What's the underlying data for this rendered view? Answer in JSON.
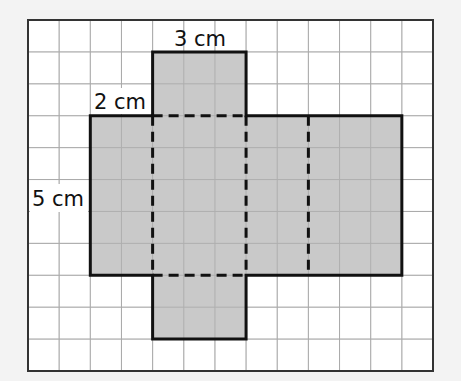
{
  "diagram": {
    "type": "net of a cuboid on square grid",
    "grid": {
      "columns": 13,
      "rows": 11,
      "frame": {
        "x": 28,
        "y": 20,
        "width": 405,
        "height": 351
      },
      "line_color": "#bdbdbd",
      "frame_color": "#333333",
      "background": "#ffffff"
    },
    "net": {
      "fill_color": "#c9c9c9",
      "outline_color": "#111111",
      "faces": [
        {
          "name": "top-flap",
          "col": 4,
          "row": 1,
          "w": 3,
          "h": 2
        },
        {
          "name": "left-face",
          "col": 2,
          "row": 3,
          "w": 2,
          "h": 5
        },
        {
          "name": "front-face",
          "col": 4,
          "row": 3,
          "w": 3,
          "h": 5
        },
        {
          "name": "right-face",
          "col": 7,
          "row": 3,
          "w": 2,
          "h": 5
        },
        {
          "name": "back-face",
          "col": 9,
          "row": 3,
          "w": 3,
          "h": 5
        },
        {
          "name": "bottom-flap",
          "col": 4,
          "row": 8,
          "w": 3,
          "h": 2
        }
      ],
      "fold_lines": [
        {
          "orientation": "vertical",
          "col": 4,
          "row_from": 3,
          "row_to": 8
        },
        {
          "orientation": "vertical",
          "col": 7,
          "row_from": 3,
          "row_to": 8
        },
        {
          "orientation": "vertical",
          "col": 9,
          "row_from": 3,
          "row_to": 8
        },
        {
          "orientation": "horizontal",
          "row": 3,
          "col_from": 4,
          "col_to": 7
        },
        {
          "orientation": "horizontal",
          "row": 8,
          "col_from": 4,
          "col_to": 7
        }
      ]
    },
    "labels": {
      "top_width": "3 cm",
      "side_width": "2 cm",
      "height": "5 cm"
    }
  }
}
